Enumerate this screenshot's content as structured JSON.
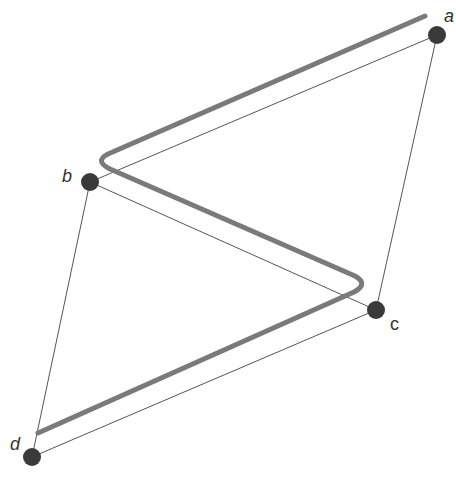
{
  "diagram": {
    "nodes": [
      {
        "id": "a",
        "label": "a",
        "x": 437,
        "y": 35,
        "lx": 444,
        "ly": 22
      },
      {
        "id": "b",
        "label": "b",
        "x": 90,
        "y": 182,
        "lx": 64,
        "ly": 180
      },
      {
        "id": "c",
        "label": "c",
        "x": 376,
        "y": 310,
        "lx": 390,
        "ly": 330
      },
      {
        "id": "d",
        "label": "d",
        "x": 32,
        "y": 457,
        "lx": 12,
        "ly": 449
      }
    ],
    "edges": [
      {
        "from": "a",
        "to": "b"
      },
      {
        "from": "b",
        "to": "c"
      },
      {
        "from": "c",
        "to": "d"
      },
      {
        "from": "a",
        "to": "c"
      },
      {
        "from": "b",
        "to": "d"
      }
    ],
    "path_description": "Thick gray zig-zag path running parallel to a-b, b-c, c-d with rounded bends",
    "colors": {
      "node": "#3a3a3a",
      "edge": "#555555",
      "path": "#7a7a7a",
      "label": "#333333"
    }
  }
}
